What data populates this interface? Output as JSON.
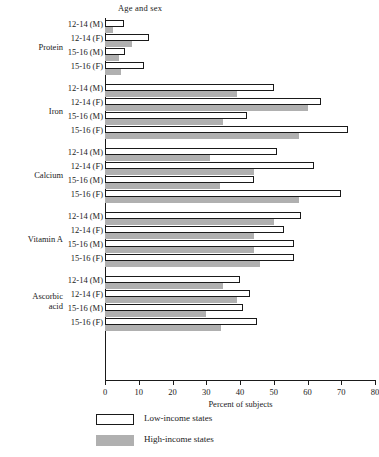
{
  "chart_data": {
    "type": "bar",
    "orientation": "horizontal",
    "title": "",
    "xlabel": "Percent of subjects",
    "ylabel": "Age and sex",
    "xlim": [
      0,
      80
    ],
    "xticks": [
      0,
      10,
      20,
      30,
      40,
      50,
      60,
      70,
      80
    ],
    "grid": false,
    "legend_position": "bottom-left",
    "legend": [
      "Low-income states",
      "High-income states"
    ],
    "series": [
      {
        "name": "Low-income states",
        "color": "#ffffff"
      },
      {
        "name": "High-income states",
        "color": "#b0b0b0"
      }
    ],
    "groups": [
      {
        "label": "Protein",
        "rows": [
          {
            "category": "12-14 (M)",
            "low_income": 5.6,
            "high_income": 2.4
          },
          {
            "category": "12-14 (F)",
            "low_income": 13.0,
            "high_income": 8.0
          },
          {
            "category": "15-16 (M)",
            "low_income": 6.0,
            "high_income": 4.0
          },
          {
            "category": "15-16 (F)",
            "low_income": 11.5,
            "high_income": 4.7
          }
        ]
      },
      {
        "label": "Iron",
        "rows": [
          {
            "category": "12-14 (M)",
            "low_income": 50.0,
            "high_income": 39.0
          },
          {
            "category": "12-14 (F)",
            "low_income": 64.0,
            "high_income": 60.0
          },
          {
            "category": "15-16 (M)",
            "low_income": 42.0,
            "high_income": 35.0
          },
          {
            "category": "15-16 (F)",
            "low_income": 72.0,
            "high_income": 57.5
          }
        ]
      },
      {
        "label": "Calcium",
        "rows": [
          {
            "category": "12-14 (M)",
            "low_income": 51.0,
            "high_income": 31.0
          },
          {
            "category": "12-14 (F)",
            "low_income": 62.0,
            "high_income": 44.0
          },
          {
            "category": "15-16 (M)",
            "low_income": 44.0,
            "high_income": 34.0
          },
          {
            "category": "15-16 (F)",
            "low_income": 70.0,
            "high_income": 57.5
          }
        ]
      },
      {
        "label": "Vitamin A",
        "rows": [
          {
            "category": "12-14 (M)",
            "low_income": 58.0,
            "high_income": 50.0
          },
          {
            "category": "12-14 (F)",
            "low_income": 53.0,
            "high_income": 44.0
          },
          {
            "category": "15-16 (M)",
            "low_income": 56.0,
            "high_income": 44.0
          },
          {
            "category": "15-16 (F)",
            "low_income": 56.0,
            "high_income": 46.0
          }
        ]
      },
      {
        "label": "Ascorbic acid",
        "label_line1": "Ascorbic",
        "label_line2": "acid",
        "rows": [
          {
            "category": "12-14 (M)",
            "low_income": 40.0,
            "high_income": 35.0
          },
          {
            "category": "12-14 (F)",
            "low_income": 43.0,
            "high_income": 39.0
          },
          {
            "category": "15-16 (M)",
            "low_income": 41.0,
            "high_income": 30.0
          },
          {
            "category": "15-16 (F)",
            "low_income": 45.0,
            "high_income": 34.5
          }
        ]
      }
    ]
  }
}
